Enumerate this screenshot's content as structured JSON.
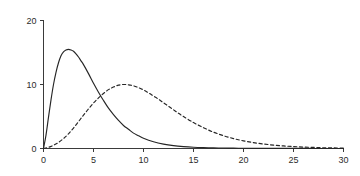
{
  "chart_data": {
    "type": "line",
    "title": "",
    "subtitle": "",
    "xlabel": "",
    "ylabel": "",
    "xlim": [
      0,
      30
    ],
    "ylim": [
      0,
      20
    ],
    "grid": false,
    "legend": null,
    "legend_position": "none",
    "xticks": [
      0,
      5,
      10,
      15,
      20,
      25,
      30
    ],
    "xtick_labels": [
      "0",
      "5",
      "10",
      "15",
      "20",
      "25",
      "30"
    ],
    "yticks": [
      0,
      10,
      20
    ],
    "ytick_labels": [
      "0",
      "10",
      "20"
    ],
    "annotations": [],
    "series": [
      {
        "name": "solid-curve",
        "style": "solid",
        "color": "#262626",
        "peak_x": 3.0,
        "peak_y": 15.5,
        "x": [
          0,
          0.25,
          0.5,
          0.75,
          1,
          1.25,
          1.5,
          1.75,
          2,
          2.25,
          2.5,
          2.75,
          3,
          3.25,
          3.5,
          3.75,
          4,
          4.5,
          5,
          5.5,
          6,
          6.5,
          7,
          7.5,
          8,
          8.5,
          9,
          9.5,
          10,
          11,
          12,
          13,
          14,
          15,
          16,
          17,
          18,
          19,
          20,
          21,
          22,
          23,
          24,
          25,
          26,
          27,
          28,
          29,
          30
        ],
        "values": [
          0,
          2.1,
          4.9,
          7.6,
          10.0,
          11.9,
          13.4,
          14.5,
          15.1,
          15.4,
          15.5,
          15.4,
          15.2,
          14.8,
          14.3,
          13.7,
          13.1,
          11.7,
          10.2,
          8.8,
          7.5,
          6.3,
          5.3,
          4.4,
          3.6,
          3.0,
          2.4,
          2.0,
          1.6,
          1.05,
          0.68,
          0.44,
          0.29,
          0.19,
          0.13,
          0.09,
          0.07,
          0.05,
          0.04,
          0.03,
          0.025,
          0.02,
          0.015,
          0.012,
          0.01,
          0.008,
          0.007,
          0.006,
          0.005
        ]
      },
      {
        "name": "dashed-curve",
        "style": "dashed",
        "color": "#262626",
        "peak_x": 8.0,
        "peak_y": 10.0,
        "x": [
          0,
          0.5,
          1,
          1.5,
          2,
          2.5,
          3,
          3.5,
          4,
          4.5,
          5,
          5.5,
          6,
          6.5,
          7,
          7.5,
          8,
          8.5,
          9,
          9.5,
          10,
          10.5,
          11,
          11.5,
          12,
          12.5,
          13,
          13.5,
          14,
          15,
          16,
          17,
          18,
          19,
          20,
          21,
          22,
          23,
          24,
          25,
          26,
          27,
          28,
          29,
          30
        ],
        "values": [
          0,
          0.18,
          0.5,
          0.95,
          1.55,
          2.3,
          3.2,
          4.2,
          5.2,
          6.2,
          7.1,
          7.9,
          8.6,
          9.2,
          9.6,
          9.9,
          10.0,
          9.95,
          9.8,
          9.5,
          9.15,
          8.7,
          8.2,
          7.7,
          7.15,
          6.6,
          6.05,
          5.5,
          5.0,
          4.05,
          3.25,
          2.55,
          2.0,
          1.55,
          1.2,
          0.92,
          0.7,
          0.53,
          0.4,
          0.3,
          0.22,
          0.17,
          0.12,
          0.09,
          0.07
        ]
      }
    ]
  }
}
